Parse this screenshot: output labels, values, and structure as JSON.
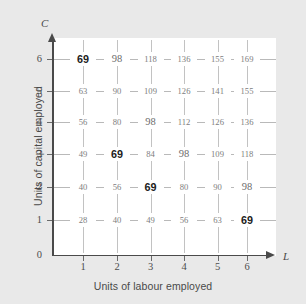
{
  "axes": {
    "y_symbol": "C",
    "x_symbol": "L",
    "y_title": "Units of capital employed",
    "x_title": "Units of labour employed",
    "y_ticks": [
      "6",
      "5",
      "4",
      "3",
      "2",
      "1",
      "0"
    ],
    "x_ticks": [
      "1",
      "2",
      "3",
      "4",
      "5",
      "6"
    ],
    "origin_label": "0"
  },
  "colors": {
    "page_background": "#e9e9e9",
    "plot_background": "#ffffff",
    "axis": "#4a4a4a",
    "grid": "#bcbcbc",
    "value_text": "#7d7d7d",
    "highlight_text": "#1c1c1c"
  },
  "chart_data": {
    "type": "table",
    "title": "",
    "xlabel": "Units of labour employed",
    "ylabel": "Units of capital employed",
    "xlim": [
      0,
      7
    ],
    "ylim": [
      0,
      7
    ],
    "grid": true,
    "x": [
      1,
      2,
      3,
      4,
      5,
      6
    ],
    "y": [
      1,
      2,
      3,
      4,
      5,
      6
    ],
    "row_labels": [
      "6",
      "5",
      "4",
      "3",
      "2",
      "1"
    ],
    "column_labels": [
      "1",
      "2",
      "3",
      "4",
      "5",
      "6"
    ],
    "rows": [
      {
        "capital": 6,
        "values": [
          69,
          98,
          118,
          136,
          155,
          169
        ]
      },
      {
        "capital": 5,
        "values": [
          63,
          90,
          109,
          126,
          141,
          155
        ]
      },
      {
        "capital": 4,
        "values": [
          56,
          80,
          98,
          112,
          126,
          136
        ]
      },
      {
        "capital": 3,
        "values": [
          49,
          69,
          84,
          98,
          109,
          118
        ]
      },
      {
        "capital": 2,
        "values": [
          40,
          56,
          69,
          80,
          90,
          98
        ]
      },
      {
        "capital": 1,
        "values": [
          28,
          40,
          49,
          56,
          63,
          69
        ]
      }
    ],
    "emphasis": {
      "bold_cells": [
        {
          "labour": 1,
          "capital": 6,
          "value": 69
        },
        {
          "labour": 2,
          "capital": 3,
          "value": 69
        },
        {
          "labour": 3,
          "capital": 2,
          "value": 69
        },
        {
          "labour": 6,
          "capital": 1,
          "value": 69
        }
      ],
      "semibold_cells": [
        {
          "labour": 2,
          "capital": 6,
          "value": 98
        },
        {
          "labour": 3,
          "capital": 4,
          "value": 98
        },
        {
          "labour": 4,
          "capital": 3,
          "value": 98
        },
        {
          "labour": 6,
          "capital": 2,
          "value": 98
        }
      ]
    }
  }
}
